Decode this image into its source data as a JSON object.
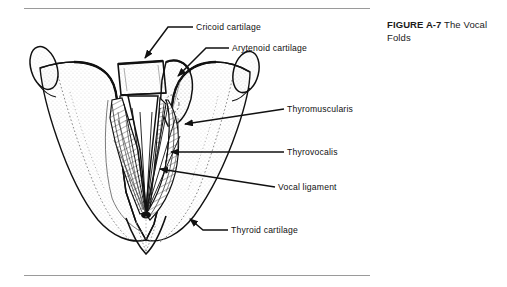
{
  "figure": {
    "id_label": "FIGURE A-7",
    "title": "The Vocal Folds",
    "background_color": "#ffffff",
    "ink_color": "#111111",
    "rule_color": "#9a9a9a"
  },
  "rules": {
    "top_label": "top-divider-rule",
    "bottom_label": "bottom-divider-rule"
  },
  "callouts": [
    {
      "key": "cricoid",
      "label": "Cricoid cartilage",
      "text_x": 196,
      "text_y": 30,
      "anchor": "start"
    },
    {
      "key": "arytenoid",
      "label": "Arytenoid cartilage",
      "text_x": 232,
      "text_y": 51,
      "anchor": "start"
    },
    {
      "key": "thyromuscularis",
      "label": "Thyromuscularis",
      "text_x": 287,
      "text_y": 112,
      "anchor": "start"
    },
    {
      "key": "thyrovocalis",
      "label": "Thyrovocalis",
      "text_x": 287,
      "text_y": 155,
      "anchor": "start"
    },
    {
      "key": "vocal_ligament",
      "label": "Vocal ligament",
      "text_x": 278,
      "text_y": 190,
      "anchor": "start"
    },
    {
      "key": "thyroid",
      "label": "Thyroid cartilage",
      "text_x": 231,
      "text_y": 233,
      "anchor": "start"
    }
  ]
}
